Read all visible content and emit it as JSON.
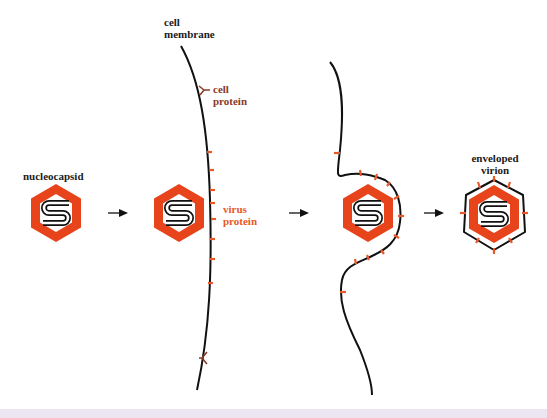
{
  "diagram": {
    "colors": {
      "capsid": "#e8441c",
      "membrane": "#111111",
      "virus_protein": "#e8582a",
      "cell_protein": "#8a3a2a",
      "text": "#1a1a1a",
      "bottom_strip": "#ece6f2"
    },
    "labels": {
      "nucleocapsid": "nucleocapsid",
      "cell_membrane_line1": "cell",
      "cell_membrane_line2": "membrane",
      "cell_protein_line1": "cell",
      "cell_protein_line2": "protein",
      "virus_protein_line1": "virus",
      "virus_protein_line2": "protein",
      "enveloped_virion_line1": "enveloped",
      "enveloped_virion_line2": "virion"
    },
    "stages": [
      {
        "name": "nucleocapsid"
      },
      {
        "name": "nucleocapsid approaches membrane"
      },
      {
        "name": "budding"
      },
      {
        "name": "enveloped virion"
      }
    ],
    "arrows": 3
  }
}
